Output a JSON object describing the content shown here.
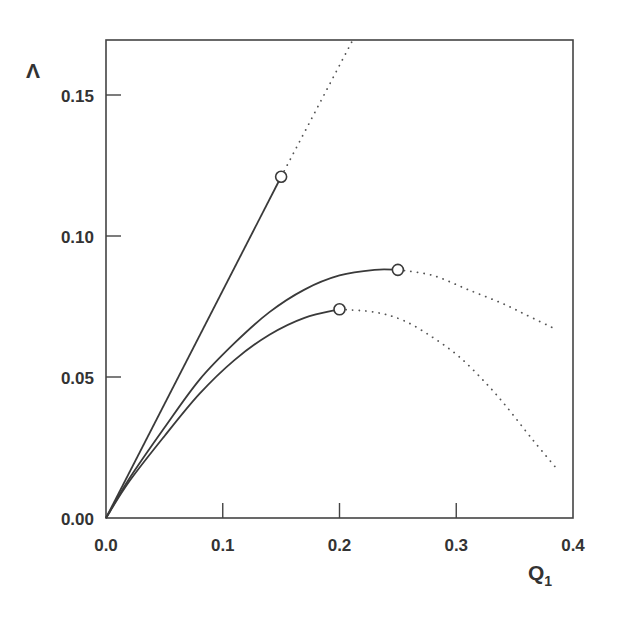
{
  "chart_data": {
    "type": "line",
    "title": "",
    "xlabel": "Q1",
    "xlabel_main": "Q",
    "xlabel_sub": "1",
    "ylabel": "Λ",
    "xlim": [
      0.0,
      0.4
    ],
    "ylim": [
      0.0,
      0.17
    ],
    "grid": false,
    "legend": null,
    "x_ticks": [
      0.0,
      0.1,
      0.2,
      0.3,
      0.4
    ],
    "x_tick_labels": [
      "0.0",
      "0.1",
      "0.2",
      "0.3",
      "0.4"
    ],
    "y_ticks": [
      0.0,
      0.05,
      0.1,
      0.15
    ],
    "y_tick_labels": [
      "0.00",
      "0.05",
      "0.10",
      "0.15"
    ],
    "series": [
      {
        "name": "upper line",
        "solid": {
          "x": [
            0.0,
            0.15
          ],
          "y": [
            0.0,
            0.121
          ]
        },
        "dotted": {
          "x": [
            0.15,
            0.212
          ],
          "y": [
            0.121,
            0.17
          ]
        },
        "marker": {
          "x": 0.15,
          "y": 0.121,
          "shape": "open-circle"
        }
      },
      {
        "name": "middle curve",
        "solid": {
          "x": [
            0.0,
            0.02,
            0.05,
            0.08,
            0.11,
            0.14,
            0.17,
            0.2,
            0.23,
            0.25
          ],
          "y": [
            0.0,
            0.014,
            0.032,
            0.049,
            0.062,
            0.073,
            0.081,
            0.086,
            0.088,
            0.088
          ]
        },
        "dotted": {
          "x": [
            0.25,
            0.28,
            0.31,
            0.34,
            0.36,
            0.385
          ],
          "y": [
            0.088,
            0.086,
            0.081,
            0.076,
            0.072,
            0.067
          ]
        },
        "marker": {
          "x": 0.25,
          "y": 0.088,
          "shape": "open-circle"
        }
      },
      {
        "name": "lower curve",
        "solid": {
          "x": [
            0.0,
            0.02,
            0.05,
            0.08,
            0.11,
            0.14,
            0.17,
            0.2
          ],
          "y": [
            0.0,
            0.013,
            0.029,
            0.044,
            0.056,
            0.065,
            0.071,
            0.074
          ]
        },
        "dotted": {
          "x": [
            0.2,
            0.23,
            0.255,
            0.28,
            0.303,
            0.325,
            0.342,
            0.365,
            0.385
          ],
          "y": [
            0.074,
            0.073,
            0.07,
            0.064,
            0.057,
            0.048,
            0.04,
            0.028,
            0.018
          ]
        },
        "marker": {
          "x": 0.2,
          "y": 0.074,
          "shape": "open-circle"
        }
      }
    ]
  },
  "colors": {
    "line": "#3a3a3a",
    "axis": "#444444",
    "text": "#333333",
    "background": "#ffffff"
  }
}
